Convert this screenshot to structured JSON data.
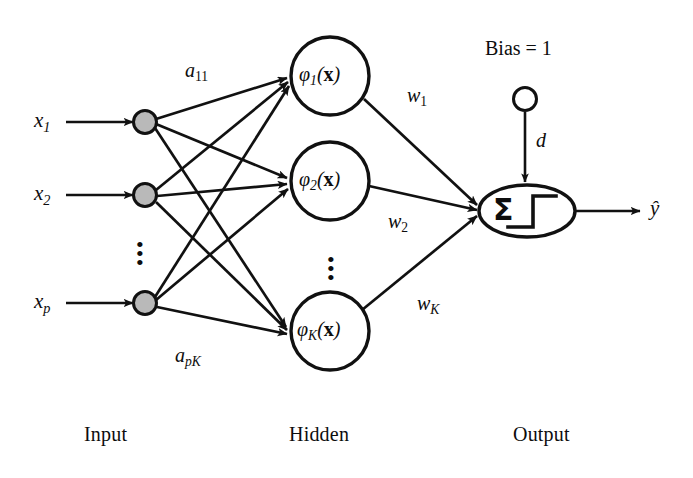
{
  "diagram": {
    "colors": {
      "stroke": "#111111",
      "input_node_fill": "#b9b9b9",
      "background": "#ffffff"
    },
    "layer_labels": {
      "input": "Input",
      "hidden": "Hidden",
      "output": "Output"
    },
    "input_layer": {
      "nodes": [
        {
          "label_base": "x",
          "label_sub": "1"
        },
        {
          "label_base": "x",
          "label_sub": "2"
        },
        {
          "label_base": "x",
          "label_sub": "p"
        }
      ],
      "ellipsis": "⋮"
    },
    "hidden_layer": {
      "nodes": [
        {
          "phi": "φ",
          "sub": "1",
          "arg_open": "(",
          "arg": "x",
          "arg_close": ")"
        },
        {
          "phi": "φ",
          "sub": "2",
          "arg_open": "(",
          "arg": "x",
          "arg_close": ")"
        },
        {
          "phi": "φ",
          "sub": "K",
          "arg_open": "(",
          "arg": "x",
          "arg_close": ")"
        }
      ],
      "ellipsis": "⋮"
    },
    "output_layer": {
      "sum_symbol": "Σ",
      "activation": "step-function",
      "output_label_base": "ŷ",
      "bias_label": "Bias = 1",
      "bias_weight_base": "d"
    },
    "weights": {
      "input_to_hidden": [
        {
          "base": "a",
          "sub": "11"
        },
        {
          "base": "a",
          "sub": "pK"
        }
      ],
      "hidden_to_output": [
        {
          "base": "w",
          "sub": "1"
        },
        {
          "base": "w",
          "sub": "2"
        },
        {
          "base": "w",
          "sub": "K"
        }
      ]
    }
  }
}
